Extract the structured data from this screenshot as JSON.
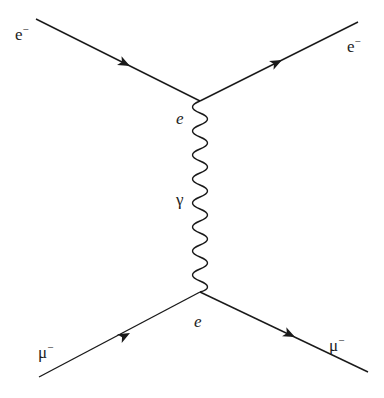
{
  "diagram": {
    "type": "feynman",
    "particles": {
      "incoming_top": {
        "label": "e",
        "charge": "−"
      },
      "outgoing_top": {
        "label": "e",
        "charge": "−"
      },
      "incoming_bottom": {
        "label": "μ",
        "charge": "−"
      },
      "outgoing_bottom": {
        "label": "μ",
        "charge": "−"
      }
    },
    "vertices": {
      "top": {
        "label": "e"
      },
      "bottom": {
        "label": "e"
      }
    },
    "propagator": {
      "label": "γ"
    },
    "colors": {
      "line": "#1a1a1a",
      "text": "#222222",
      "background": "#ffffff"
    }
  }
}
